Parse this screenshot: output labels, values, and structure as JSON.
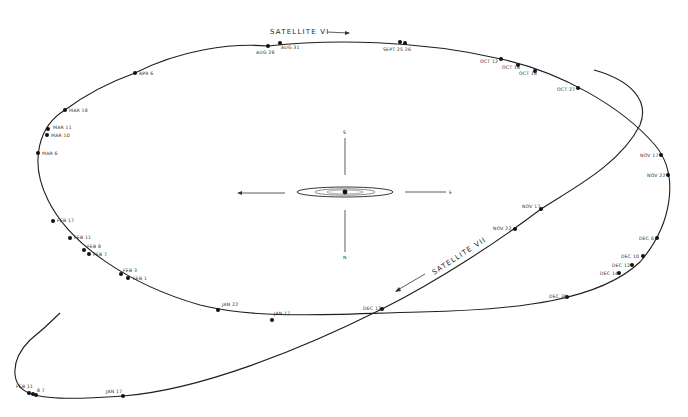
{
  "diagram": {
    "satellite_vi": {
      "label": "SATELLITE VI",
      "points": [
        {
          "label": "AUG 28",
          "x": 268,
          "y": 46,
          "lx": 256,
          "ly": 54
        },
        {
          "label": "AUG 31",
          "x": 280,
          "y": 43,
          "lx": 281,
          "ly": 49
        },
        {
          "label": "SEPT 25 26",
          "x": 400,
          "y": 42,
          "lx": 383,
          "ly": 51
        },
        {
          "label": "",
          "x": 405,
          "y": 43,
          "lx": 0,
          "ly": 0
        },
        {
          "label": "OCT 12",
          "x": 501,
          "y": 59,
          "lx": 480,
          "ly": 63
        },
        {
          "label": "OCT 16",
          "x": 518,
          "y": 65,
          "lx": 502,
          "ly": 69
        },
        {
          "label": "OCT 18",
          "x": 535,
          "y": 71,
          "lx": 519,
          "ly": 75
        },
        {
          "label": "OCT 27",
          "x": 578,
          "y": 88,
          "lx": 557,
          "ly": 91
        },
        {
          "label": "NOV 17",
          "x": 661,
          "y": 155,
          "lx": 640,
          "ly": 157
        },
        {
          "label": "NOV 22",
          "x": 668,
          "y": 175,
          "lx": 647,
          "ly": 177
        },
        {
          "label": "DEC 6",
          "x": 657,
          "y": 238,
          "lx": 639,
          "ly": 240
        },
        {
          "label": "DEC 10",
          "x": 643,
          "y": 256,
          "lx": 621,
          "ly": 258
        },
        {
          "label": "DEC 12",
          "x": 632,
          "y": 265,
          "lx": 612,
          "ly": 267
        },
        {
          "label": "DEC 14",
          "x": 619,
          "y": 273,
          "lx": 600,
          "ly": 275
        },
        {
          "label": "DEC 30",
          "x": 567,
          "y": 297,
          "lx": 549,
          "ly": 298
        },
        {
          "label": "JAN 22",
          "x": 218,
          "y": 310,
          "lx": 222,
          "ly": 306
        },
        {
          "label": "JAN 17",
          "x": 272,
          "y": 320,
          "lx": 274,
          "ly": 315
        },
        {
          "label": "FEB 3",
          "x": 121,
          "y": 274,
          "lx": 123,
          "ly": 272
        },
        {
          "label": "FEB 1",
          "x": 128,
          "y": 278,
          "lx": 133,
          "ly": 280
        },
        {
          "label": "FEB 8",
          "x": 84,
          "y": 250,
          "lx": 87,
          "ly": 248
        },
        {
          "label": "FEB 7",
          "x": 89,
          "y": 254,
          "lx": 93,
          "ly": 256
        },
        {
          "label": "FEB 11",
          "x": 70,
          "y": 238,
          "lx": 74,
          "ly": 239
        },
        {
          "label": "FEB 17",
          "x": 53,
          "y": 221,
          "lx": 57,
          "ly": 222
        },
        {
          "label": "MAR 6",
          "x": 38,
          "y": 153,
          "lx": 42,
          "ly": 155
        },
        {
          "label": "MAR 10",
          "x": 47,
          "y": 135,
          "lx": 51,
          "ly": 137
        },
        {
          "label": "MAR 11",
          "x": 48,
          "y": 129,
          "lx": 53,
          "ly": 129
        },
        {
          "label": "MAR 18",
          "x": 65,
          "y": 110,
          "lx": 69,
          "ly": 112
        },
        {
          "label": "APR 6",
          "x": 135,
          "y": 73,
          "lx": 139,
          "ly": 75
        }
      ]
    },
    "satellite_vii": {
      "label": "SATELLITE VII",
      "points": [
        {
          "label": "NOV 17",
          "x": 541,
          "y": 209,
          "lx": 522,
          "ly": 208
        },
        {
          "label": "NOV 22",
          "x": 515,
          "y": 229,
          "lx": 493,
          "ly": 230
        },
        {
          "label": "DEC 12",
          "x": 382,
          "y": 309,
          "lx": 363,
          "ly": 310
        },
        {
          "label": "JAN 17",
          "x": 123,
          "y": 396,
          "lx": 106,
          "ly": 393
        },
        {
          "label": "FEB 11",
          "x": 29,
          "y": 393,
          "lx": 16,
          "ly": 388
        },
        {
          "label": "",
          "x": 33,
          "y": 394,
          "lx": 0,
          "ly": 0
        },
        {
          "label": "8 7",
          "x": 36,
          "y": 395,
          "lx": 37,
          "ly": 392
        }
      ]
    },
    "compass": {
      "north": "N",
      "south": "S",
      "east": "E",
      "west": "W"
    },
    "center": {
      "name": "planet",
      "x": 345,
      "y": 192
    }
  }
}
